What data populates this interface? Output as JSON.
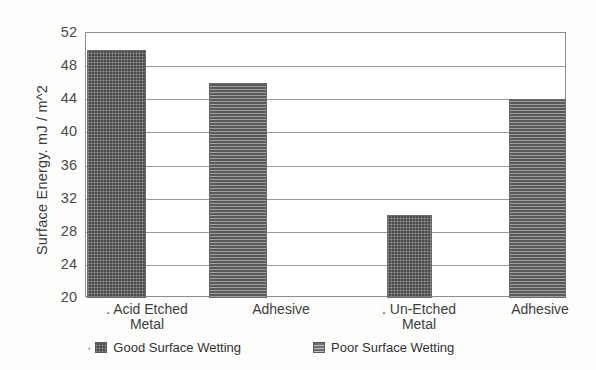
{
  "chart_data": {
    "type": "bar",
    "title": "",
    "xlabel": "",
    "ylabel": "Surface Energy. mJ / m^2",
    "ylim": [
      20,
      52
    ],
    "ytick_step": 4,
    "yticks": [
      52,
      48,
      44,
      40,
      36,
      32,
      28,
      24,
      20
    ],
    "grid": true,
    "legend_position": "bottom",
    "categories": [
      ". Acid Etched Metal",
      "Adhesive",
      ". Un-Etched Metal",
      "Adhesive"
    ],
    "category_lines": [
      [
        ". Acid Etched",
        "Metal"
      ],
      [
        "Adhesive"
      ],
      [
        ". Un-Etched",
        "Metal"
      ],
      [
        "Adhesive"
      ]
    ],
    "values": [
      50,
      46,
      30,
      44
    ],
    "bars": [
      {
        "label": "Acid Etched Metal",
        "value": 50,
        "series": "Good Surface Wetting"
      },
      {
        "label": "Adhesive",
        "value": 46,
        "series": "Poor Surface Wetting"
      },
      {
        "label": "Un-Etched Metal",
        "value": 30,
        "series": "Good Surface Wetting"
      },
      {
        "label": "Adhesive",
        "value": 44,
        "series": "Poor Surface Wetting"
      }
    ],
    "series": [
      {
        "name": "Good Surface Wetting",
        "values": [
          50,
          null,
          30,
          null
        ]
      },
      {
        "name": "Poor Surface Wetting",
        "values": [
          null,
          46,
          null,
          44
        ]
      }
    ],
    "legend": [
      {
        "label": "Good Surface Wetting",
        "marker_dot": "·",
        "color": "#4a4a4a"
      },
      {
        "label": "Poor Surface Wetting",
        "marker_dot": "",
        "color": "#6e6e6e"
      }
    ],
    "colors": {
      "good": "#4a4a4a",
      "poor": "#6e6e6e",
      "grid": "#9b9b9b",
      "frame": "#8d8d8d",
      "background": "#fdfdfc",
      "plot_background": "#ffffff",
      "text": "#3c3c3c"
    },
    "tick_dot": "."
  }
}
